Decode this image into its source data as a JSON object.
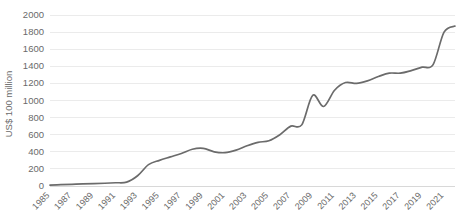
{
  "chart_data": {
    "type": "line",
    "title": "",
    "subtitle": "",
    "xlabel": "",
    "ylabel": "US$ 100 million",
    "xlim": [
      1985,
      2022
    ],
    "ylim": [
      0,
      2000
    ],
    "grid": true,
    "legend": false,
    "legend_position": "none",
    "line_color": "#6b6b6b",
    "grid_color": "#e9e9e9",
    "text_color": "#6a6a6a",
    "background_color": "#ffffff",
    "ytick_labels": [
      "0",
      "200",
      "400",
      "600",
      "800",
      "1000",
      "1200",
      "1400",
      "1600",
      "1800",
      "2000"
    ],
    "ytick_values": [
      0,
      200,
      400,
      600,
      800,
      1000,
      1200,
      1400,
      1600,
      1800,
      2000
    ],
    "xtick_labels": [
      "1985",
      "1987",
      "1989",
      "1991",
      "1993",
      "1995",
      "1997",
      "1999",
      "2001",
      "2003",
      "2005",
      "2007",
      "2009",
      "2011",
      "2013",
      "2015",
      "2017",
      "2019",
      "2021"
    ],
    "xtick_values": [
      1985,
      1987,
      1989,
      1991,
      1993,
      1995,
      1997,
      1999,
      2001,
      2003,
      2005,
      2007,
      2009,
      2011,
      2013,
      2015,
      2017,
      2019,
      2021
    ],
    "x": [
      1985,
      1986,
      1987,
      1988,
      1989,
      1990,
      1991,
      1992,
      1993,
      1994,
      1995,
      1996,
      1997,
      1998,
      1999,
      2000,
      2001,
      2002,
      2003,
      2004,
      2005,
      2006,
      2007,
      2008,
      2009,
      2010,
      2011,
      2012,
      2013,
      2014,
      2015,
      2016,
      2017,
      2018,
      2019,
      2020,
      2021,
      2022
    ],
    "values": [
      10,
      15,
      20,
      25,
      28,
      32,
      38,
      45,
      120,
      250,
      300,
      340,
      380,
      430,
      440,
      400,
      390,
      420,
      470,
      510,
      530,
      600,
      700,
      715,
      1060,
      930,
      1120,
      1210,
      1200,
      1230,
      1280,
      1320,
      1320,
      1350,
      1390,
      1420,
      1800,
      1870
    ],
    "series": [
      {
        "name": "US$ 100 million",
        "values": [
          10,
          15,
          20,
          25,
          28,
          32,
          38,
          45,
          120,
          250,
          300,
          340,
          380,
          430,
          440,
          400,
          390,
          420,
          470,
          510,
          530,
          600,
          700,
          715,
          1060,
          930,
          1120,
          1210,
          1200,
          1230,
          1280,
          1320,
          1320,
          1350,
          1390,
          1420,
          1800,
          1870
        ]
      }
    ]
  }
}
